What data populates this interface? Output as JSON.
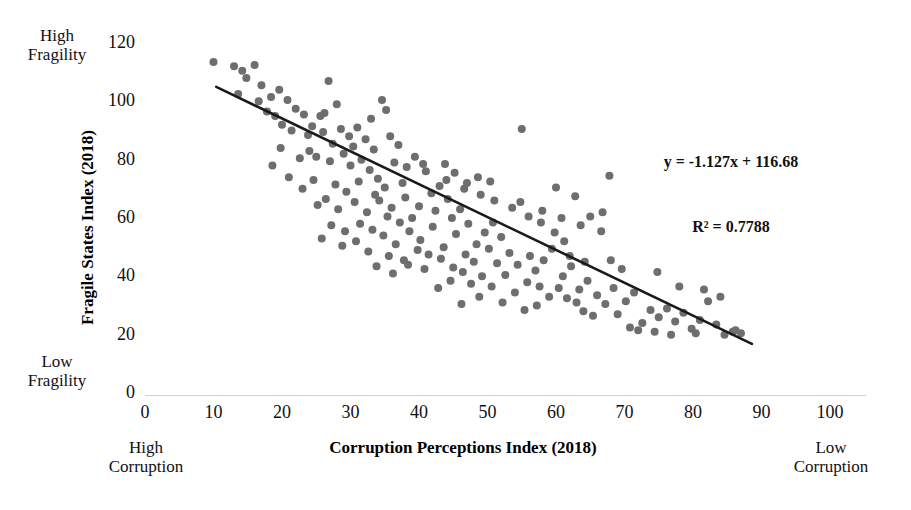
{
  "figure": {
    "background": "#ffffff",
    "marker_color": "#6e6e6e",
    "trendline_color": "#1a1a1a"
  },
  "annotations": {
    "equation": "y = -1.127x + 116.68",
    "r_squared": "R² = 0.7788",
    "y_high_label_line1": "High",
    "y_high_label_line2": "Fragility",
    "y_low_label_line1": "Low",
    "y_low_label_line2": "Fragility",
    "x_left_label_line1": "High",
    "x_left_label_line2": "Corruption",
    "x_right_label_line1": "Low",
    "x_right_label_line2": "Corruption"
  },
  "chart_data": {
    "type": "scatter",
    "title": "",
    "xlabel": "Corruption Perceptions Index (2018)",
    "ylabel": "Fragile States Index (2018)",
    "xlim": [
      0,
      100
    ],
    "ylim": [
      0,
      120
    ],
    "xticks": [
      0,
      10,
      20,
      30,
      40,
      50,
      60,
      70,
      80,
      90,
      100
    ],
    "yticks": [
      0,
      20,
      40,
      60,
      80,
      100,
      120
    ],
    "grid": false,
    "legend": null,
    "marker_size": 8,
    "trendline": {
      "type": "linear",
      "slope": -1.127,
      "intercept": 116.68,
      "r_squared": 0.7788,
      "x_start": 10.4,
      "x_end": 88.6,
      "equation_text": "y = -1.127x + 116.68",
      "r2_text": "R² = 0.7788"
    },
    "series": [
      {
        "name": "Countries",
        "points": [
          [
            10.0,
            113.5
          ],
          [
            13.0,
            112.0
          ],
          [
            14.2,
            110.5
          ],
          [
            14.8,
            108.0
          ],
          [
            16.0,
            112.5
          ],
          [
            17.0,
            105.5
          ],
          [
            13.6,
            102.5
          ],
          [
            16.6,
            100.0
          ],
          [
            18.4,
            101.5
          ],
          [
            19.6,
            104.0
          ],
          [
            20.8,
            100.5
          ],
          [
            17.8,
            96.5
          ],
          [
            19.0,
            95.0
          ],
          [
            22.0,
            97.5
          ],
          [
            23.2,
            95.5
          ],
          [
            20.0,
            92.0
          ],
          [
            21.4,
            90.0
          ],
          [
            24.4,
            91.5
          ],
          [
            25.6,
            95.0
          ],
          [
            26.8,
            107.0
          ],
          [
            28.0,
            99.0
          ],
          [
            26.2,
            96.0
          ],
          [
            23.8,
            88.5
          ],
          [
            26.0,
            89.5
          ],
          [
            28.6,
            90.5
          ],
          [
            29.8,
            88.0
          ],
          [
            31.0,
            91.0
          ],
          [
            32.2,
            87.0
          ],
          [
            30.4,
            84.5
          ],
          [
            27.4,
            85.5
          ],
          [
            24.0,
            83.0
          ],
          [
            22.6,
            80.5
          ],
          [
            19.8,
            84.0
          ],
          [
            21.0,
            74.0
          ],
          [
            18.6,
            78.0
          ],
          [
            25.0,
            81.0
          ],
          [
            27.0,
            79.5
          ],
          [
            29.0,
            82.0
          ],
          [
            31.6,
            80.0
          ],
          [
            33.4,
            83.5
          ],
          [
            34.6,
            100.5
          ],
          [
            35.2,
            97.0
          ],
          [
            33.0,
            94.0
          ],
          [
            30.0,
            78.0
          ],
          [
            32.8,
            76.5
          ],
          [
            35.8,
            88.0
          ],
          [
            37.0,
            85.0
          ],
          [
            34.0,
            73.5
          ],
          [
            36.4,
            79.0
          ],
          [
            38.2,
            77.5
          ],
          [
            39.4,
            81.0
          ],
          [
            40.6,
            78.5
          ],
          [
            37.6,
            72.0
          ],
          [
            35.0,
            70.5
          ],
          [
            33.6,
            68.0
          ],
          [
            31.2,
            72.5
          ],
          [
            29.4,
            69.0
          ],
          [
            27.8,
            71.5
          ],
          [
            26.4,
            66.5
          ],
          [
            24.6,
            73.0
          ],
          [
            23.0,
            70.0
          ],
          [
            25.2,
            64.5
          ],
          [
            28.2,
            63.0
          ],
          [
            30.6,
            65.5
          ],
          [
            32.4,
            62.0
          ],
          [
            34.2,
            66.0
          ],
          [
            36.0,
            63.5
          ],
          [
            38.0,
            67.0
          ],
          [
            40.0,
            64.0
          ],
          [
            41.8,
            68.5
          ],
          [
            43.0,
            71.0
          ],
          [
            44.2,
            66.5
          ],
          [
            42.4,
            62.5
          ],
          [
            39.0,
            60.0
          ],
          [
            37.2,
            58.5
          ],
          [
            35.4,
            60.5
          ],
          [
            33.2,
            56.0
          ],
          [
            31.4,
            58.0
          ],
          [
            29.2,
            55.5
          ],
          [
            27.2,
            57.5
          ],
          [
            25.8,
            53.0
          ],
          [
            28.8,
            50.5
          ],
          [
            30.8,
            52.0
          ],
          [
            32.6,
            48.5
          ],
          [
            34.8,
            54.0
          ],
          [
            36.6,
            51.0
          ],
          [
            38.6,
            55.5
          ],
          [
            40.2,
            52.5
          ],
          [
            42.0,
            57.0
          ],
          [
            44.8,
            60.0
          ],
          [
            46.0,
            63.0
          ],
          [
            47.2,
            58.0
          ],
          [
            45.4,
            54.5
          ],
          [
            43.6,
            50.0
          ],
          [
            41.4,
            47.5
          ],
          [
            39.8,
            49.0
          ],
          [
            37.8,
            45.5
          ],
          [
            35.6,
            47.0
          ],
          [
            33.8,
            43.5
          ],
          [
            36.2,
            41.0
          ],
          [
            38.4,
            44.0
          ],
          [
            40.8,
            42.5
          ],
          [
            43.2,
            46.0
          ],
          [
            45.0,
            43.0
          ],
          [
            46.8,
            47.5
          ],
          [
            48.4,
            51.0
          ],
          [
            49.6,
            55.0
          ],
          [
            50.8,
            58.5
          ],
          [
            52.0,
            53.5
          ],
          [
            50.2,
            49.5
          ],
          [
            48.0,
            45.0
          ],
          [
            46.4,
            41.5
          ],
          [
            44.6,
            38.5
          ],
          [
            42.8,
            36.0
          ],
          [
            47.6,
            37.5
          ],
          [
            49.2,
            40.0
          ],
          [
            51.4,
            44.5
          ],
          [
            53.2,
            48.0
          ],
          [
            54.4,
            44.0
          ],
          [
            52.6,
            40.5
          ],
          [
            50.6,
            36.5
          ],
          [
            48.8,
            33.0
          ],
          [
            46.2,
            30.5
          ],
          [
            52.2,
            31.0
          ],
          [
            54.0,
            34.5
          ],
          [
            55.8,
            38.0
          ],
          [
            57.0,
            42.0
          ],
          [
            55.0,
            90.5
          ],
          [
            56.2,
            47.0
          ],
          [
            58.2,
            45.5
          ],
          [
            59.4,
            49.5
          ],
          [
            57.6,
            36.5
          ],
          [
            59.0,
            33.0
          ],
          [
            57.2,
            30.0
          ],
          [
            55.4,
            28.5
          ],
          [
            61.0,
            40.0
          ],
          [
            62.2,
            43.5
          ],
          [
            60.4,
            36.0
          ],
          [
            61.6,
            32.5
          ],
          [
            63.4,
            35.5
          ],
          [
            64.6,
            38.5
          ],
          [
            63.0,
            31.0
          ],
          [
            64.0,
            28.0
          ],
          [
            66.0,
            33.5
          ],
          [
            67.2,
            30.5
          ],
          [
            65.4,
            26.5
          ],
          [
            68.4,
            36.0
          ],
          [
            67.8,
            74.5
          ],
          [
            62.8,
            67.5
          ],
          [
            60.0,
            70.5
          ],
          [
            58.0,
            62.5
          ],
          [
            56.0,
            60.5
          ],
          [
            53.6,
            63.5
          ],
          [
            51.0,
            66.0
          ],
          [
            49.0,
            68.0
          ],
          [
            47.0,
            72.0
          ],
          [
            45.2,
            75.5
          ],
          [
            43.8,
            78.5
          ],
          [
            41.0,
            76.0
          ],
          [
            44.0,
            73.0
          ],
          [
            46.6,
            70.0
          ],
          [
            48.6,
            74.0
          ],
          [
            50.4,
            72.5
          ],
          [
            54.8,
            65.5
          ],
          [
            57.8,
            58.5
          ],
          [
            59.8,
            55.0
          ],
          [
            61.2,
            52.0
          ],
          [
            63.6,
            57.5
          ],
          [
            65.0,
            60.5
          ],
          [
            66.6,
            55.5
          ],
          [
            62.0,
            47.0
          ],
          [
            64.2,
            45.0
          ],
          [
            69.0,
            27.0
          ],
          [
            70.2,
            31.5
          ],
          [
            71.4,
            34.5
          ],
          [
            72.6,
            24.0
          ],
          [
            73.8,
            28.5
          ],
          [
            70.8,
            22.5
          ],
          [
            72.0,
            21.5
          ],
          [
            75.0,
            26.0
          ],
          [
            76.2,
            29.0
          ],
          [
            77.4,
            24.5
          ],
          [
            74.4,
            21.0
          ],
          [
            78.6,
            27.5
          ],
          [
            79.8,
            22.0
          ],
          [
            81.0,
            25.0
          ],
          [
            82.2,
            31.5
          ],
          [
            80.4,
            20.5
          ],
          [
            83.4,
            23.5
          ],
          [
            84.6,
            20.0
          ],
          [
            85.8,
            21.0
          ],
          [
            87.0,
            20.5
          ],
          [
            86.2,
            21.5
          ],
          [
            84.0,
            33.0
          ],
          [
            81.6,
            35.5
          ],
          [
            78.0,
            36.5
          ],
          [
            76.8,
            20.0
          ],
          [
            74.8,
            41.5
          ],
          [
            69.6,
            42.5
          ],
          [
            68.0,
            45.5
          ],
          [
            66.8,
            62.0
          ],
          [
            60.8,
            60.0
          ]
        ]
      }
    ]
  }
}
